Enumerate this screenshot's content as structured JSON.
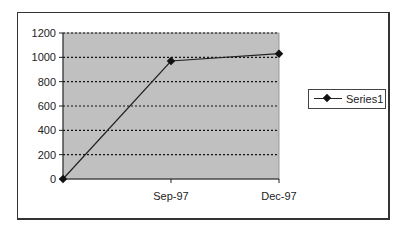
{
  "chart_data": {
    "type": "line",
    "title": "",
    "xlabel": "",
    "ylabel": "",
    "categories": [
      "",
      "Sep-97",
      "Dec-97"
    ],
    "series": [
      {
        "name": "Series1",
        "values": [
          0,
          970,
          1030
        ],
        "color": "#222222",
        "marker": "diamond"
      }
    ],
    "ylim": [
      0,
      1200
    ],
    "yticks": [
      0,
      200,
      400,
      600,
      800,
      1000,
      1200
    ],
    "ytick_labels": [
      "0",
      "200",
      "400",
      "600",
      "800",
      "1000",
      "1200"
    ],
    "xtick_labels": [
      "",
      "Sep-97",
      "Dec-97"
    ],
    "grid": {
      "horizontal": true,
      "style": "dotted",
      "color": "#111111"
    },
    "plot_background": "#c0c0c0",
    "legend": {
      "position": "right",
      "entries": [
        "Series1"
      ]
    }
  },
  "legend": {
    "label": "Series1"
  }
}
